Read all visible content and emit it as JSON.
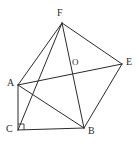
{
  "figure": {
    "type": "line-diagram",
    "canvas": {
      "width": 138,
      "height": 144
    },
    "stroke_color": "#2b2b2b",
    "background_color": "#ffffff",
    "vertices": [
      {
        "id": "F",
        "label": "F",
        "x": 62,
        "y": 23,
        "label_x": 57,
        "label_y": 8,
        "role": "apex-top"
      },
      {
        "id": "E",
        "label": "E",
        "x": 122,
        "y": 64,
        "label_x": 126,
        "label_y": 57,
        "role": "right"
      },
      {
        "id": "A",
        "label": "A",
        "x": 18,
        "y": 85,
        "label_x": 7,
        "label_y": 78,
        "role": "left"
      },
      {
        "id": "C",
        "label": "C",
        "x": 18,
        "y": 130,
        "label_x": 6,
        "label_y": 124,
        "role": "bottom-left"
      },
      {
        "id": "B",
        "label": "B",
        "x": 84,
        "y": 128,
        "label_x": 88,
        "label_y": 126,
        "role": "bottom-right"
      },
      {
        "id": "O",
        "label": "O",
        "x": 73,
        "y": 71,
        "label_x": 72,
        "label_y": 57,
        "role": "interior-intersection"
      }
    ],
    "edges": [
      {
        "id": "AF",
        "from": "A",
        "to": "F",
        "x1": 18,
        "y1": 85,
        "x2": 62,
        "y2": 23
      },
      {
        "id": "FE",
        "from": "F",
        "to": "E",
        "x1": 62,
        "y1": 23,
        "x2": 122,
        "y2": 64
      },
      {
        "id": "AE",
        "from": "A",
        "to": "E",
        "x1": 18,
        "y1": 85,
        "x2": 122,
        "y2": 64,
        "through": "O"
      },
      {
        "id": "FB",
        "from": "F",
        "to": "B",
        "x1": 62,
        "y1": 23,
        "x2": 84,
        "y2": 128,
        "through": "O"
      },
      {
        "id": "CF",
        "from": "C",
        "to": "F",
        "x1": 18,
        "y1": 130,
        "x2": 62,
        "y2": 23,
        "through": "O"
      },
      {
        "id": "AB",
        "from": "A",
        "to": "B",
        "x1": 18,
        "y1": 85,
        "x2": 84,
        "y2": 128
      },
      {
        "id": "AC",
        "from": "A",
        "to": "C",
        "x1": 18,
        "y1": 85,
        "x2": 18,
        "y2": 130
      },
      {
        "id": "CB",
        "from": "C",
        "to": "B",
        "x1": 18,
        "y1": 130,
        "x2": 84,
        "y2": 128
      },
      {
        "id": "BE",
        "from": "B",
        "to": "E",
        "x1": 84,
        "y1": 128,
        "x2": 122,
        "y2": 64
      }
    ],
    "markers": [
      {
        "id": "right-angle-C",
        "type": "right-angle",
        "at": "C",
        "points": "18,124 24,124 24,130"
      }
    ]
  }
}
